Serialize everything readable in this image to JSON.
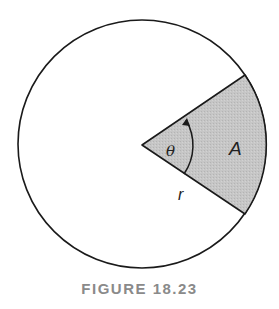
{
  "figure": {
    "caption": "FIGURE 18.23",
    "labels": {
      "angle": "θ",
      "area": "A",
      "radius": "r"
    },
    "colors": {
      "stroke": "#1a1a1a",
      "sector_fill": "#c4c4c4",
      "background": "#ffffff",
      "caption": "#8a8a8a"
    }
  }
}
